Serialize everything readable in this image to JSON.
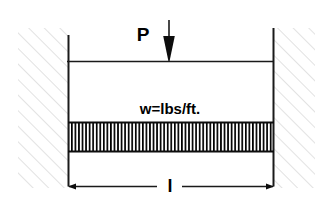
{
  "diagram": {
    "type": "structural-beam-free-body-diagram",
    "colors": {
      "line": "#1a1a1a",
      "wall_hatch": "#d8d8d8",
      "load_hatch": "#000000",
      "background": "#ffffff"
    },
    "labels": {
      "point_load": "P",
      "distributed_load": "w=lbs/ft.",
      "span": "l"
    },
    "elements": {
      "left_wall_name": "left-fixed-support",
      "right_wall_name": "right-fixed-support",
      "beam_name": "beam-top-line",
      "point_load_name": "point-load-arrow",
      "distributed_load_name": "distributed-load-block",
      "dimension_name": "span-dimension-line"
    },
    "geometry": {
      "beam_left_x": 68,
      "beam_right_x": 273,
      "beam_top_y": 61,
      "wall_top_y": 35,
      "wall_bottom_y": 186,
      "load_block_top_y": 122,
      "load_block_bottom_y": 152,
      "dimension_y": 186,
      "arrow_x": 169,
      "arrow_top_y": 20,
      "hatch_count": 58
    }
  }
}
